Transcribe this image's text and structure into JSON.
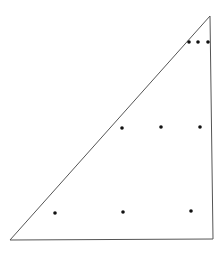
{
  "diagram": {
    "width": 224,
    "height": 253,
    "background": "#ffffff",
    "stroke_color": "#555555",
    "dot_color": "#111111",
    "triangle": {
      "points": [
        [
          10,
          240
        ],
        [
          210,
          16
        ],
        [
          213,
          239
        ]
      ]
    },
    "dots": [
      {
        "x": 189,
        "y": 42
      },
      {
        "x": 198,
        "y": 42
      },
      {
        "x": 208,
        "y": 42
      },
      {
        "x": 122,
        "y": 128
      },
      {
        "x": 161,
        "y": 127
      },
      {
        "x": 200,
        "y": 127
      },
      {
        "x": 55,
        "y": 213
      },
      {
        "x": 123,
        "y": 212
      },
      {
        "x": 191,
        "y": 211
      }
    ],
    "dot_radius": 1.8
  }
}
